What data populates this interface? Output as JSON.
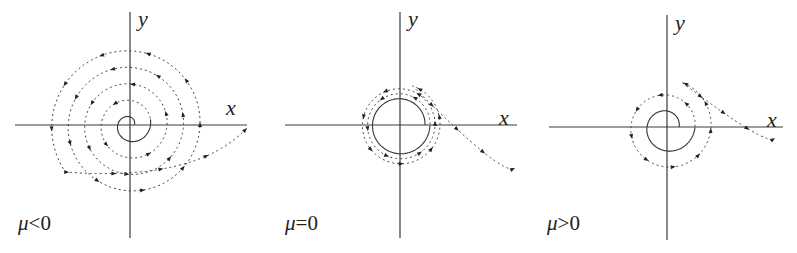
{
  "figure": {
    "panels": [
      {
        "id": "mu-negative",
        "condition_label": {
          "symbol": "μ",
          "relation": "<",
          "value": "0"
        },
        "axis_labels": {
          "x": "x",
          "y": "y"
        },
        "origin": [
          130,
          125
        ],
        "x_axis": [
          15,
          247
        ],
        "y_axis": [
          12,
          238
        ],
        "x_label_pos": [
          226,
          97
        ],
        "y_label_pos": [
          138,
          8
        ],
        "mu_label_pos": [
          18,
          213
        ],
        "spiral": {
          "r_start": 4,
          "solid_turn_end": 1.05,
          "total_turns": 4.6,
          "growth_per_turn": 16.5,
          "tail_extra": 0.55,
          "tail_end": [
            247,
            128
          ],
          "arrow_count": 28
        },
        "description": "Stable focus: trajectory spirals inward toward origin (dashed arrows point inward)"
      },
      {
        "id": "mu-zero",
        "condition_label": {
          "symbol": "μ",
          "relation": "=",
          "value": "0"
        },
        "axis_labels": {
          "x": "x",
          "y": "y"
        },
        "origin": [
          400,
          125
        ],
        "x_axis": [
          285,
          517
        ],
        "y_axis": [
          12,
          238
        ],
        "x_label_pos": [
          499,
          107
        ],
        "y_label_pos": [
          408,
          8
        ],
        "mu_label_pos": [
          285,
          213
        ],
        "spiral": {
          "r_start": 25,
          "solid_turn_end": 1.0,
          "total_turns": 3.2,
          "growth_per_turn": 5.0,
          "tail_extra": 0.55,
          "tail_end": [
            515,
            168
          ],
          "arrow_count": 18
        },
        "description": "Weak focus: slow convergence to origin"
      },
      {
        "id": "mu-positive",
        "condition_label": {
          "symbol": "μ",
          "relation": ">",
          "value": "0"
        },
        "axis_labels": {
          "x": "x",
          "y": "y"
        },
        "origin": [
          667,
          127
        ],
        "x_axis": [
          549,
          783
        ],
        "y_axis": [
          15,
          240
        ],
        "x_label_pos": [
          767,
          109
        ],
        "y_label_pos": [
          675,
          12
        ],
        "mu_label_pos": [
          547,
          213
        ],
        "spiral": {
          "r_start": 12,
          "solid_turn_end": 1.0,
          "total_turns": 2.2,
          "growth_per_turn": 16.0,
          "tail_extra": 0.55,
          "tail_end": [
            775,
            138
          ],
          "arrow_count": 14
        },
        "description": "Unstable focus: trajectory spirals outward from origin"
      }
    ],
    "colors": {
      "line": "#333333",
      "background": "#ffffff"
    }
  }
}
